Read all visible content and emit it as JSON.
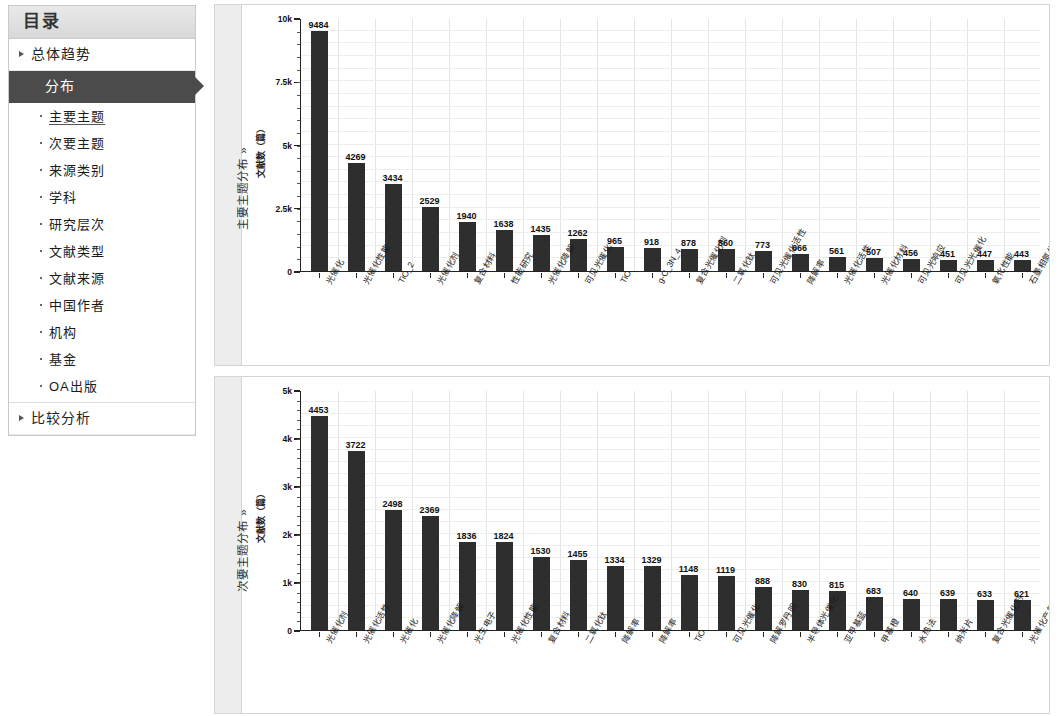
{
  "sidebar": {
    "title": "目录",
    "top_items": [
      {
        "label": "总体趋势",
        "selected": false
      },
      {
        "label": "分布",
        "selected": true
      },
      {
        "label": "比较分析",
        "selected": false
      }
    ],
    "sub_items": [
      {
        "label": "主要主题",
        "active": true
      },
      {
        "label": "次要主题",
        "active": false
      },
      {
        "label": "来源类别",
        "active": false
      },
      {
        "label": "学科",
        "active": false
      },
      {
        "label": "研究层次",
        "active": false
      },
      {
        "label": "文献类型",
        "active": false
      },
      {
        "label": "文献来源",
        "active": false
      },
      {
        "label": "中国作者",
        "active": false
      },
      {
        "label": "机构",
        "active": false
      },
      {
        "label": "基金",
        "active": false
      },
      {
        "label": "OA出版",
        "active": false
      }
    ]
  },
  "panels": [
    {
      "tab_label": "主要主题分布 »"
    },
    {
      "tab_label": "次要主题分布 »"
    }
  ],
  "chart_data": [
    {
      "type": "bar",
      "title": "主要主题分布",
      "xlabel": "",
      "ylabel": "文献数（篇）",
      "ylim": [
        0,
        10000
      ],
      "yticks": [
        0,
        2500,
        5000,
        7500,
        10000
      ],
      "ytick_labels": [
        "0",
        "2.5k",
        "5k",
        "7.5k",
        "10k"
      ],
      "grid": true,
      "legend": null,
      "categories": [
        "光催化",
        "光催化性能",
        "TiO_2",
        "光催化剂",
        "复合材料",
        "性能研究",
        "光催化降解",
        "可见光催化",
        "TiO",
        "g-C_3N_4",
        "复合光催化剂",
        "二氧化钛",
        "可见光催化活性",
        "降解率",
        "光催化活性",
        "光催化材料",
        "可见光响应",
        "可见光光催化",
        "氧化性能",
        "石墨相氮化碳"
      ],
      "values": [
        9484,
        4269,
        3434,
        2529,
        1940,
        1638,
        1435,
        1262,
        965,
        918,
        878,
        860,
        773,
        666,
        561,
        507,
        456,
        451,
        447,
        443
      ]
    },
    {
      "type": "bar",
      "title": "次要主题分布",
      "xlabel": "",
      "ylabel": "文献数（篇）",
      "ylim": [
        0,
        5000
      ],
      "yticks": [
        0,
        1000,
        2000,
        3000,
        4000,
        5000
      ],
      "ytick_labels": [
        "0",
        "1k",
        "2k",
        "3k",
        "4k",
        "5k"
      ],
      "grid": true,
      "legend": null,
      "categories": [
        "光催化剂",
        "光催化活性",
        "光催化",
        "光催化降解",
        "光生电子",
        "光催化性能",
        "复合材料",
        "二氧化钛",
        "降解率",
        "降解率",
        "TiO",
        "可见光催化",
        "降解罗丹明",
        "半导体光催化",
        "亚甲基蓝",
        "甲基橙",
        "水热法",
        "纳米片",
        "复合光催化剂",
        "光催化产氢",
        "罗丹明"
      ],
      "values": [
        4453,
        3722,
        2498,
        2369,
        1836,
        1824,
        1530,
        1455,
        1334,
        1329,
        1148,
        1119,
        888,
        830,
        815,
        683,
        640,
        639,
        633,
        621
      ]
    }
  ],
  "colors": {
    "bar": "#2e2e2e",
    "selected_nav_bg": "#4b4b4b",
    "panel_border": "#d5d5d5",
    "side_tab_bg": "#ededed"
  }
}
